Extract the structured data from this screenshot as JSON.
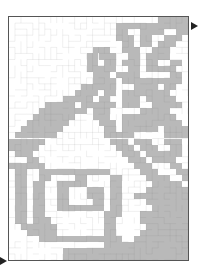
{
  "puzzle": {
    "type": "maze",
    "grid_cols": 30,
    "grid_rows": 40,
    "colors": {
      "shade": "#b9b9b9",
      "wall": "#777777",
      "border": "#555555",
      "arrow": "#222222",
      "background": "#ffffff"
    },
    "entry": {
      "side": "bottom-left",
      "icon": "arrow-right"
    },
    "exit": {
      "side": "top-right",
      "icon": "arrow-right"
    },
    "shaded_rows": [
      [
        [
          25,
          29
        ]
      ],
      [
        [
          18,
          29
        ]
      ],
      [
        [
          18,
          19
        ],
        [
          22,
          25
        ],
        [
          28,
          29
        ]
      ],
      [
        [
          18,
          20
        ],
        [
          22,
          23
        ],
        [
          26,
          28
        ]
      ],
      [
        [
          19,
          20
        ],
        [
          22,
          23
        ],
        [
          25,
          27
        ]
      ],
      [
        [
          14,
          16
        ],
        [
          19,
          21
        ],
        [
          24,
          26
        ]
      ],
      [
        [
          13,
          14
        ],
        [
          15,
          17
        ],
        [
          20,
          21
        ],
        [
          23,
          26
        ]
      ],
      [
        [
          13,
          14
        ],
        [
          16,
          17
        ],
        [
          19,
          21
        ],
        [
          23,
          24
        ],
        [
          27,
          28
        ]
      ],
      [
        [
          13,
          17
        ],
        [
          20,
          21
        ],
        [
          23,
          27
        ]
      ],
      [
        [
          14,
          16
        ],
        [
          18,
          19
        ],
        [
          20,
          21
        ],
        [
          27,
          28
        ]
      ],
      [
        [
          14,
          17
        ],
        [
          19,
          21
        ],
        [
          22,
          28
        ]
      ],
      [
        [
          12,
          17
        ],
        [
          21,
          22
        ],
        [
          23,
          24
        ],
        [
          26,
          27
        ]
      ],
      [
        [
          11,
          12
        ],
        [
          13,
          14
        ],
        [
          16,
          17
        ],
        [
          19,
          23
        ],
        [
          24,
          26
        ]
      ],
      [
        [
          9,
          13
        ],
        [
          15,
          16
        ],
        [
          19,
          21
        ],
        [
          23,
          27
        ]
      ],
      [
        [
          6,
          10
        ],
        [
          12,
          17
        ],
        [
          19,
          21
        ],
        [
          24,
          28
        ]
      ],
      [
        [
          5,
          8
        ],
        [
          9,
          12
        ],
        [
          14,
          16
        ],
        [
          22,
          26
        ]
      ],
      [
        [
          4,
          7
        ],
        [
          8,
          10
        ],
        [
          14,
          16
        ],
        [
          19,
          23
        ],
        [
          24,
          27
        ]
      ],
      [
        [
          3,
          6
        ],
        [
          7,
          9
        ],
        [
          15,
          17
        ],
        [
          19,
          28
        ]
      ],
      [
        [
          2,
          5
        ],
        [
          6,
          8
        ],
        [
          16,
          17
        ],
        [
          19,
          24
        ],
        [
          26,
          29
        ]
      ],
      [
        [
          1,
          4
        ],
        [
          5,
          7
        ],
        [
          16,
          18
        ],
        [
          19,
          20
        ],
        [
          26,
          29
        ]
      ],
      [
        [
          0,
          2
        ],
        [
          3,
          5
        ],
        [
          17,
          19
        ],
        [
          21,
          23
        ],
        [
          26,
          28
        ]
      ],
      [
        [
          0,
          4
        ],
        [
          18,
          20
        ],
        [
          22,
          24
        ],
        [
          27,
          28
        ]
      ],
      [
        [
          1,
          3
        ],
        [
          19,
          21
        ],
        [
          23,
          26
        ],
        [
          27,
          28
        ]
      ],
      [
        [
          3,
          4
        ],
        [
          20,
          22
        ],
        [
          24,
          27
        ]
      ],
      [
        [
          0,
          3
        ],
        [
          4,
          5
        ],
        [
          21,
          23
        ],
        [
          27,
          28
        ]
      ],
      [
        [
          1,
          2
        ],
        [
          5,
          16
        ],
        [
          22,
          24
        ],
        [
          28,
          29
        ]
      ],
      [
        [
          1,
          2
        ],
        [
          5,
          6
        ],
        [
          11,
          12
        ],
        [
          17,
          18
        ],
        [
          23,
          26
        ],
        [
          29,
          29
        ]
      ],
      [
        [
          1,
          2
        ],
        [
          4,
          5
        ],
        [
          8,
          12
        ],
        [
          17,
          18
        ],
        [
          24,
          28
        ]
      ],
      [
        [
          1,
          2
        ],
        [
          4,
          5
        ],
        [
          8,
          9
        ],
        [
          13,
          15
        ],
        [
          17,
          18
        ],
        [
          23,
          29
        ]
      ],
      [
        [
          1,
          2
        ],
        [
          4,
          5
        ],
        [
          8,
          9
        ],
        [
          13,
          15
        ],
        [
          17,
          18
        ],
        [
          21,
          26
        ],
        [
          27,
          29
        ]
      ],
      [
        [
          1,
          2
        ],
        [
          4,
          5
        ],
        [
          8,
          9
        ],
        [
          14,
          15
        ],
        [
          17,
          18
        ],
        [
          23,
          29
        ]
      ],
      [
        [
          1,
          2
        ],
        [
          4,
          5
        ],
        [
          8,
          15
        ],
        [
          17,
          18
        ],
        [
          24,
          29
        ]
      ],
      [
        [
          1,
          2
        ],
        [
          4,
          5
        ],
        [
          16,
          18
        ],
        [
          22,
          29
        ]
      ],
      [
        [
          1,
          2
        ],
        [
          4,
          6
        ],
        [
          16,
          17
        ],
        [
          22,
          29
        ]
      ],
      [
        [
          2,
          7
        ],
        [
          16,
          17
        ],
        [
          23,
          29
        ]
      ],
      [
        [
          3,
          7
        ],
        [
          16,
          17
        ],
        [
          22,
          29
        ]
      ],
      [
        [
          5,
          18
        ],
        [
          21,
          29
        ]
      ],
      [
        [
          16,
          19
        ],
        [
          20,
          29
        ]
      ],
      [
        [
          9,
          29
        ]
      ],
      [
        [
          9,
          29
        ]
      ]
    ]
  }
}
